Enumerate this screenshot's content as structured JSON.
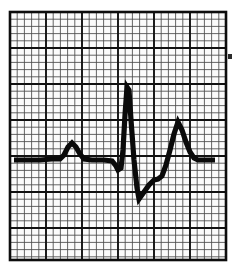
{
  "figure": {
    "kind": "ecg-waveform-strip",
    "caption": "",
    "background_color": "#ffffff",
    "paper_color": "#fbfbfb",
    "trace_color": "#0a0a0a",
    "grid_minor_color": "#4a4a4a",
    "grid_major_color": "#111111",
    "frame_color": "#0d0d0d"
  },
  "grid": {
    "left": 10,
    "top": 12,
    "right": 226,
    "bottom": 260,
    "minor_spacing": 7.2,
    "major_every": 5,
    "minor_stroke_width": 0.85,
    "major_stroke_width": 1.9,
    "frame_stroke_width": 2.6,
    "description": "Standard ECG paper: small squares with bold line every fifth square"
  },
  "chart_data": {
    "type": "line",
    "title": "",
    "xlabel": "",
    "ylabel": "",
    "grid": true,
    "legend": "none",
    "baseline_y": 160,
    "trace_stroke_width": 5.2,
    "xlim": [
      10,
      226
    ],
    "ylim": [
      260,
      12
    ],
    "annotations": [
      {
        "label": "P wave",
        "x": 72,
        "y": 143
      },
      {
        "label": "Q wave",
        "x": 118,
        "y": 170
      },
      {
        "label": "R wave",
        "x": 127,
        "y": 86
      },
      {
        "label": "S wave",
        "x": 139,
        "y": 199
      },
      {
        "label": "T wave",
        "x": 178,
        "y": 122
      }
    ],
    "points": [
      [
        14,
        160
      ],
      [
        40,
        160
      ],
      [
        52,
        159
      ],
      [
        60,
        159
      ],
      [
        64,
        155
      ],
      [
        68,
        147
      ],
      [
        72,
        143
      ],
      [
        76,
        147
      ],
      [
        80,
        154
      ],
      [
        84,
        159
      ],
      [
        92,
        160
      ],
      [
        104,
        160
      ],
      [
        112,
        161
      ],
      [
        116,
        166
      ],
      [
        118,
        170
      ],
      [
        121,
        168
      ],
      [
        123,
        150
      ],
      [
        125,
        115
      ],
      [
        127,
        87
      ],
      [
        129,
        90
      ],
      [
        131,
        120
      ],
      [
        134,
        160
      ],
      [
        137,
        188
      ],
      [
        139,
        199
      ],
      [
        144,
        192
      ],
      [
        149,
        185
      ],
      [
        154,
        180
      ],
      [
        158,
        179
      ],
      [
        162,
        176
      ],
      [
        166,
        165
      ],
      [
        170,
        150
      ],
      [
        174,
        134
      ],
      [
        178,
        122
      ],
      [
        182,
        130
      ],
      [
        186,
        142
      ],
      [
        190,
        152
      ],
      [
        194,
        158
      ],
      [
        198,
        160
      ],
      [
        206,
        160
      ],
      [
        215,
        160
      ]
    ]
  },
  "marks": [
    {
      "name": "right-edge-tick",
      "x": 228,
      "y": 54,
      "width": 4,
      "height": 5
    }
  ]
}
